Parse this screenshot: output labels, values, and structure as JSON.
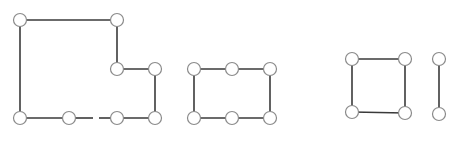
{
  "diagram": {
    "type": "graph-components",
    "colors": {
      "background": "#ffffff",
      "edge": "#3a3a3a",
      "node_stroke": "#8a8a8a",
      "node_fill": "#ffffff"
    },
    "node_radius": 6.5,
    "components": [
      {
        "id": "component-1",
        "shape": "L-shaped polygon (10 edges, one bottom edge broken)",
        "nodes": [
          {
            "id": "a1",
            "x": 20,
            "y": 20
          },
          {
            "id": "a2",
            "x": 117,
            "y": 20
          },
          {
            "id": "a3",
            "x": 117,
            "y": 69
          },
          {
            "id": "a4",
            "x": 155,
            "y": 69
          },
          {
            "id": "a5",
            "x": 155,
            "y": 118
          },
          {
            "id": "a6",
            "x": 117,
            "y": 118
          },
          {
            "id": "a7",
            "x": 69,
            "y": 118
          },
          {
            "id": "a8",
            "x": 20,
            "y": 118
          }
        ],
        "edges": [
          {
            "from": "a1",
            "to": "a2"
          },
          {
            "from": "a2",
            "to": "a3"
          },
          {
            "from": "a3",
            "to": "a4"
          },
          {
            "from": "a4",
            "to": "a5"
          },
          {
            "from": "a5",
            "to": "a6"
          },
          {
            "from": "a6",
            "to": "a7",
            "broken": true,
            "gap": [
              93,
              99
            ]
          },
          {
            "from": "a7",
            "to": "a8"
          },
          {
            "from": "a8",
            "to": "a1"
          }
        ]
      },
      {
        "id": "component-2",
        "shape": "rectangle with 6 nodes",
        "nodes": [
          {
            "id": "b1",
            "x": 194,
            "y": 69
          },
          {
            "id": "b2",
            "x": 232,
            "y": 69
          },
          {
            "id": "b3",
            "x": 270,
            "y": 69
          },
          {
            "id": "b4",
            "x": 270,
            "y": 118
          },
          {
            "id": "b5",
            "x": 232,
            "y": 118
          },
          {
            "id": "b6",
            "x": 194,
            "y": 118
          }
        ],
        "edges": [
          {
            "from": "b1",
            "to": "b2"
          },
          {
            "from": "b2",
            "to": "b3"
          },
          {
            "from": "b3",
            "to": "b4"
          },
          {
            "from": "b4",
            "to": "b5"
          },
          {
            "from": "b5",
            "to": "b6"
          },
          {
            "from": "b6",
            "to": "b1"
          }
        ]
      },
      {
        "id": "component-3",
        "shape": "square with 4 nodes",
        "nodes": [
          {
            "id": "c1",
            "x": 352,
            "y": 59
          },
          {
            "id": "c2",
            "x": 405,
            "y": 59
          },
          {
            "id": "c3",
            "x": 405,
            "y": 113
          },
          {
            "id": "c4",
            "x": 352,
            "y": 112
          }
        ],
        "edges": [
          {
            "from": "c1",
            "to": "c2"
          },
          {
            "from": "c2",
            "to": "c3"
          },
          {
            "from": "c3",
            "to": "c4"
          },
          {
            "from": "c4",
            "to": "c1"
          }
        ]
      },
      {
        "id": "component-4",
        "shape": "single vertical edge",
        "nodes": [
          {
            "id": "d1",
            "x": 439,
            "y": 59
          },
          {
            "id": "d2",
            "x": 439,
            "y": 114
          }
        ],
        "edges": [
          {
            "from": "d1",
            "to": "d2"
          }
        ]
      }
    ]
  }
}
